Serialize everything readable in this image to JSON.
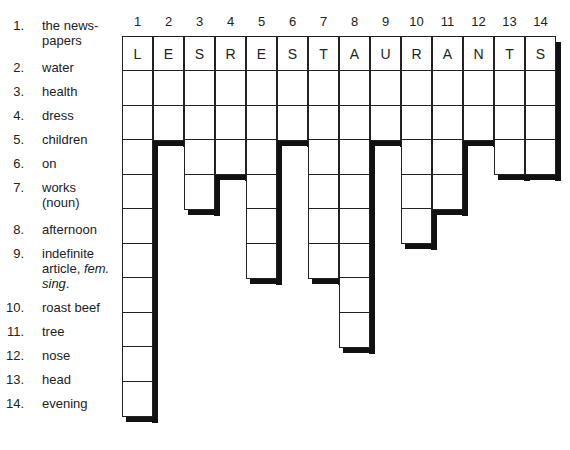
{
  "clues": [
    {
      "num": "1.",
      "lines": [
        "the news-",
        "papers"
      ]
    },
    {
      "num": "2.",
      "lines": [
        "water"
      ]
    },
    {
      "num": "3.",
      "lines": [
        "health"
      ]
    },
    {
      "num": "4.",
      "lines": [
        "dress"
      ]
    },
    {
      "num": "5.",
      "lines": [
        "children"
      ]
    },
    {
      "num": "6.",
      "lines": [
        "on"
      ]
    },
    {
      "num": "7.",
      "lines": [
        "works",
        "(noun)"
      ]
    },
    {
      "num": "8.",
      "lines": [
        "afternoon"
      ]
    },
    {
      "num": "9.",
      "lines": [
        "indefinite",
        "article, fem.",
        "sing."
      ]
    },
    {
      "num": "10.",
      "lines": [
        "roast beef"
      ]
    },
    {
      "num": "11.",
      "lines": [
        "tree"
      ]
    },
    {
      "num": "12.",
      "lines": [
        "nose"
      ]
    },
    {
      "num": "13.",
      "lines": [
        "head"
      ]
    },
    {
      "num": "14.",
      "lines": [
        "evening"
      ]
    }
  ],
  "grid": {
    "column_numbers": [
      "1",
      "2",
      "3",
      "4",
      "5",
      "6",
      "7",
      "8",
      "9",
      "10",
      "11",
      "12",
      "13",
      "14"
    ],
    "top_word": [
      "L",
      "E",
      "S",
      "R",
      "E",
      "S",
      "T",
      "A",
      "U",
      "R",
      "A",
      "N",
      "T",
      "S"
    ],
    "column_lengths": [
      11,
      3,
      5,
      4,
      7,
      3,
      7,
      9,
      3,
      6,
      5,
      3,
      4,
      4
    ]
  }
}
